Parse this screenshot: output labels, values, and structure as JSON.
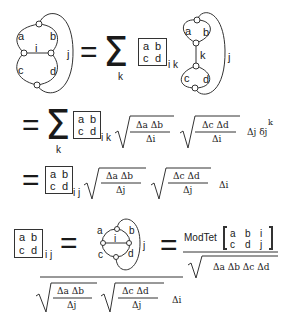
{
  "figure": {
    "line1": {
      "lhs_graph": {
        "edge_labels": [
          "a",
          "b",
          "i",
          "c",
          "d",
          "j"
        ]
      },
      "equals": "=",
      "sum_symbol": "Σ",
      "sum_index": "k",
      "symbol_box": {
        "a": "a",
        "b": "b",
        "c": "c",
        "d": "d"
      },
      "box_subscript": "i k",
      "rhs_graph": {
        "edge_labels": [
          "a",
          "b",
          "k",
          "c",
          "d",
          "j"
        ]
      }
    },
    "line2": {
      "equals": "=",
      "sum_symbol": "Σ",
      "sum_index": "k",
      "symbol_box": {
        "a": "a",
        "b": "b",
        "c": "c",
        "d": "d"
      },
      "box_subscript": "i k",
      "sqrt1": {
        "numerator": "Δa Δb",
        "denominator": "Δi"
      },
      "sqrt2": {
        "numerator": "Δc Δd",
        "denominator": "Δi"
      },
      "trailing": "Δj δj",
      "trailing_sup": "k"
    },
    "line3": {
      "equals": "=",
      "symbol_box": {
        "a": "a",
        "b": "b",
        "c": "c",
        "d": "d"
      },
      "box_subscript": "i j",
      "sqrt1": {
        "numerator": "Δa Δb",
        "denominator": "Δj"
      },
      "sqrt2": {
        "numerator": "Δc Δd",
        "denominator": "Δj"
      },
      "trailing": "Δi"
    },
    "line4": {
      "symbol_box": {
        "a": "a",
        "b": "b",
        "c": "c",
        "d": "d"
      },
      "box_subscript": "i j",
      "equals1": "=",
      "tet_graph": {
        "edge_labels": [
          "a",
          "b",
          "i",
          "c",
          "d",
          "j"
        ]
      },
      "equals2": "=",
      "modtet": {
        "label": "ModTet",
        "matrix": [
          [
            "a",
            "b",
            "i"
          ],
          [
            "c",
            "d",
            "j"
          ]
        ]
      },
      "modtet_denominator": "Δa Δb Δc Δd",
      "lhs_denominator": {
        "sqrt1": {
          "numerator": "Δa Δb",
          "denominator": "Δj"
        },
        "sqrt2": {
          "numerator": "Δc Δd",
          "denominator": "Δj"
        },
        "trailing": "Δi"
      }
    }
  }
}
